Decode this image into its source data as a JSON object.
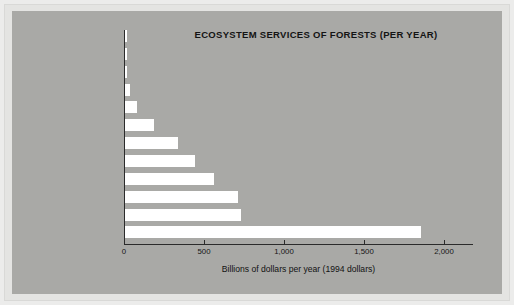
{
  "figure": {
    "background_color": "#a9a9a6",
    "bar_color": "#ffffff",
    "axis_color": "#2b2b2b"
  },
  "chart_data": {
    "type": "bar",
    "orientation": "horizontal",
    "title": "ECOSYSTEM SERVICES OF FORESTS (PER YEAR)",
    "xlabel": "Billions of dollars per year (1994 dollars)",
    "ylabel": "",
    "xlim": [
      0,
      2180
    ],
    "xticks": [
      0,
      500,
      1000,
      1500,
      2000
    ],
    "xtick_labels": [
      "0",
      "500",
      "1,000",
      "1,500",
      "2,000"
    ],
    "grid": false,
    "legend": false,
    "categories": [
      "Natural pest control",
      "Cultural uses",
      "Disturbance regulation",
      "Water services",
      "Genetic resources",
      "Food",
      "Recreation",
      "Waste treatment",
      "Soil issues",
      "Raw materials",
      "Climate regulation",
      "Nutrient cycling"
    ],
    "values": [
      12,
      12,
      12,
      30,
      75,
      180,
      330,
      440,
      555,
      705,
      725,
      1850
    ]
  }
}
